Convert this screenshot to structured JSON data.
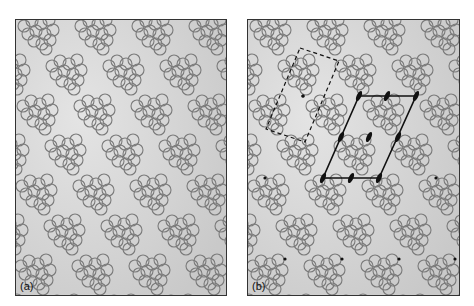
{
  "figure": {
    "panels": [
      {
        "id": "a",
        "label": "(a)"
      },
      {
        "id": "b",
        "label": "(b)"
      }
    ],
    "colors": {
      "background": "#c9c9c9",
      "background_light": "#e4e4e4",
      "circle_stroke": "#7a7a7a",
      "lattice_line": "#111111",
      "border": "#333333"
    },
    "motif": {
      "circle_radius": 6,
      "offsets": [
        [
          -14,
          -8
        ],
        [
          -6,
          -13
        ],
        [
          3,
          -10
        ],
        [
          11,
          -14
        ],
        [
          -10,
          0
        ],
        [
          -2,
          -3
        ],
        [
          7,
          0
        ],
        [
          15,
          -4
        ],
        [
          -4,
          7
        ],
        [
          4,
          10
        ],
        [
          12,
          6
        ],
        [
          8,
          15
        ]
      ]
    },
    "lattice": {
      "a": [
        57,
        0
      ],
      "b": [
        28,
        40
      ],
      "origin": [
        22,
        14
      ]
    },
    "panel_b_overlays": {
      "dashed_cell": [
        [
          52,
          28
        ],
        [
          91,
          41
        ],
        [
          57,
          122
        ],
        [
          18,
          109
        ]
      ],
      "unit_cell": [
        [
          111,
          76
        ],
        [
          168,
          76
        ],
        [
          131,
          158
        ],
        [
          75,
          158
        ]
      ],
      "twofold_axes": [
        [
          111,
          76,
          0
        ],
        [
          139,
          76,
          0
        ],
        [
          168,
          76,
          0
        ],
        [
          93,
          117,
          0
        ],
        [
          121,
          117,
          0
        ],
        [
          150,
          117,
          0
        ],
        [
          75,
          158,
          0
        ],
        [
          103,
          158,
          0
        ],
        [
          131,
          158,
          0
        ]
      ],
      "dots": [
        [
          55,
          76
        ],
        [
          17,
          158
        ],
        [
          188,
          158
        ],
        [
          37,
          239
        ],
        [
          94,
          239
        ],
        [
          151,
          239
        ],
        [
          207,
          239
        ]
      ]
    }
  }
}
